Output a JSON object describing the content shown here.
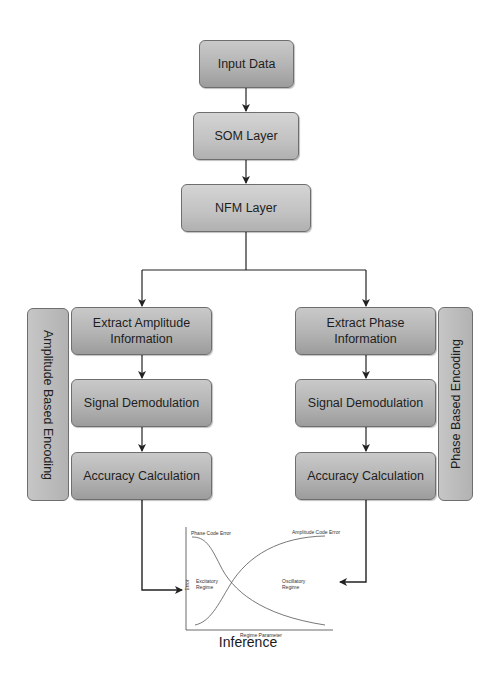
{
  "diagram": {
    "top_flow": [
      {
        "id": "input",
        "label": "Input Data"
      },
      {
        "id": "som",
        "label": "SOM Layer"
      },
      {
        "id": "nfm",
        "label": "NFM Layer"
      }
    ],
    "left_branch": {
      "group_label": "Amplitude Based Encoding",
      "steps": [
        {
          "label": "Extract Amplitude Information"
        },
        {
          "label": "Signal Demodulation"
        },
        {
          "label": "Accuracy Calculation"
        }
      ]
    },
    "right_branch": {
      "group_label": "Phase Based Encoding",
      "steps": [
        {
          "label": "Extract Phase Information"
        },
        {
          "label": "Signal Demodulation"
        },
        {
          "label": "Accuracy Calculation"
        }
      ]
    },
    "output": {
      "label": "Inference",
      "plot": {
        "y_axis_label": "Error",
        "x_axis_label": "Regime Parameter",
        "curve_left_label": "Phase Code Error",
        "curve_right_label": "Amplitude Code Error",
        "region_left": "Excitatory Regime",
        "region_right": "Oscillatory Regime"
      }
    },
    "colors": {
      "box_fill": "#b8b8b8",
      "box_border": "#6e6e6e",
      "arrow": "#222222",
      "background": "#ffffff"
    }
  }
}
